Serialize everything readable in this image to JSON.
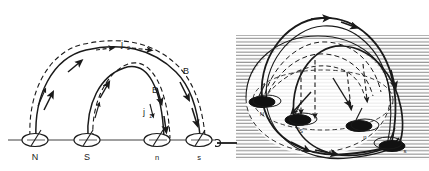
{
  "figure": {
    "background_color": "#ffffff",
    "ink_color": "#1a1a1a",
    "hatch_color": "#8c8c8c"
  },
  "panels": [
    {
      "id": "left",
      "name": "two-dimensional-side-view",
      "description": "Side projection of two interlocking coronal loops anchored at four photospheric footpoints",
      "baseline_label": "photospheric surface",
      "footpoints": [
        {
          "label": "N",
          "polarity": "positive-leading",
          "x": 35,
          "marker": "open-ellipse"
        },
        {
          "label": "S",
          "polarity": "negative-leading",
          "x": 87,
          "marker": "open-ellipse"
        },
        {
          "label": "n",
          "polarity": "positive-following",
          "x": 157,
          "marker": "open-ellipse"
        },
        {
          "label": "s",
          "polarity": "negative-following",
          "x": 199,
          "marker": "open-ellipse"
        }
      ],
      "annotations": [
        {
          "text": "j",
          "sub": "2",
          "x": 123,
          "y": 47,
          "meaning": "interaction-current-upper"
        },
        {
          "text": "B",
          "sub": "",
          "x": 153,
          "y": 92,
          "meaning": "magnetic-field-inner-loop"
        },
        {
          "text": "j",
          "sub": "1",
          "x": 146,
          "y": 113,
          "meaning": "interaction-current-lower"
        },
        {
          "text": "B",
          "sub": "",
          "x": 186,
          "y": 73,
          "meaning": "magnetic-field-outer-loop"
        }
      ],
      "legend": {
        "solid_meaning": "magnetic field line B",
        "dashed_meaning": "electric current j"
      }
    },
    {
      "id": "right",
      "name": "three-dimensional-perspective-view",
      "description": "Perspective rendering of the same four-footpoint loop system above a hatched stratified atmosphere",
      "footpoints": [
        {
          "label": "N",
          "polarity": "positive-leading",
          "x": 45,
          "y": 100,
          "marker": "filled-ellipse"
        },
        {
          "label": "S",
          "polarity": "negative-leading",
          "x": 78,
          "y": 120,
          "marker": "filled-ellipse"
        },
        {
          "label": "n",
          "polarity": "positive-following",
          "x": 148,
          "y": 129,
          "marker": "filled-ellipse"
        },
        {
          "label": "s",
          "polarity": "negative-following",
          "x": 180,
          "y": 148,
          "marker": "filled-ellipse"
        }
      ],
      "hatching": {
        "orientation": "horizontal",
        "spacing_px": 3.4,
        "meaning": "stratified background atmosphere"
      },
      "axis_marker": {
        "name": "left-axis-arrow",
        "direction": "right"
      }
    }
  ]
}
